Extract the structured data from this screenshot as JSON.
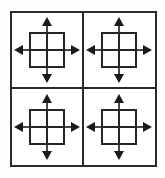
{
  "figure": {
    "description": "A bordered square divided into a 2 by 2 grid of four identical cells; each cell contains a small square subdivided into a 2 by 2 grid with four solid arrows pointing up, down, left and right away from it.",
    "background_color": "#fdfdfd",
    "line_color": "#2b2b2b",
    "arrow_color": "#1a1a1a",
    "outer_frame": {
      "name": "outer-frame",
      "rows": 2,
      "columns": 2,
      "border_width_px": 2
    },
    "cells": [
      {
        "id": "cell-top-left",
        "label": "top-left",
        "row": 1,
        "column": 1,
        "inner_square": {
          "rows": 2,
          "columns": 2,
          "label": "2x2 subdivided square"
        },
        "arrows": [
          {
            "direction": "up",
            "label": "up arrow",
            "glyph": "↑"
          },
          {
            "direction": "right",
            "label": "right arrow",
            "glyph": "→"
          },
          {
            "direction": "down",
            "label": "down arrow",
            "glyph": "↓"
          },
          {
            "direction": "left",
            "label": "left arrow",
            "glyph": "←"
          }
        ]
      },
      {
        "id": "cell-top-right",
        "label": "top-right",
        "row": 1,
        "column": 2,
        "inner_square": {
          "rows": 2,
          "columns": 2,
          "label": "2x2 subdivided square"
        },
        "arrows": [
          {
            "direction": "up",
            "label": "up arrow",
            "glyph": "↑"
          },
          {
            "direction": "right",
            "label": "right arrow",
            "glyph": "→"
          },
          {
            "direction": "down",
            "label": "down arrow",
            "glyph": "↓"
          },
          {
            "direction": "left",
            "label": "left arrow",
            "glyph": "←"
          }
        ]
      },
      {
        "id": "cell-bottom-left",
        "label": "bottom-left",
        "row": 2,
        "column": 1,
        "inner_square": {
          "rows": 2,
          "columns": 2,
          "label": "2x2 subdivided square"
        },
        "arrows": [
          {
            "direction": "up",
            "label": "up arrow",
            "glyph": "↑"
          },
          {
            "direction": "right",
            "label": "right arrow",
            "glyph": "→"
          },
          {
            "direction": "down",
            "label": "down arrow",
            "glyph": "↓"
          },
          {
            "direction": "left",
            "label": "left arrow",
            "glyph": "←"
          }
        ]
      },
      {
        "id": "cell-bottom-right",
        "label": "bottom-right",
        "row": 2,
        "column": 2,
        "inner_square": {
          "rows": 2,
          "columns": 2,
          "label": "2x2 subdivided square"
        },
        "arrows": [
          {
            "direction": "up",
            "label": "up arrow",
            "glyph": "↑"
          },
          {
            "direction": "right",
            "label": "right arrow",
            "glyph": "→"
          },
          {
            "direction": "down",
            "label": "down arrow",
            "glyph": "↓"
          },
          {
            "direction": "left",
            "label": "left arrow",
            "glyph": "←"
          }
        ]
      }
    ]
  }
}
